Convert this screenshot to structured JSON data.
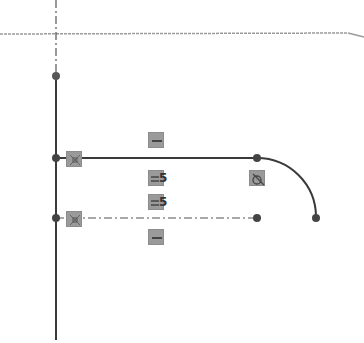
{
  "sketch": {
    "colors": {
      "geometry": "#3a3a3a",
      "construction": "#6a6a6a",
      "axis": "#9a9a9a",
      "constraint_bg": "#9a9a9a"
    },
    "axes": {
      "horizontal_y": 34,
      "vertical_x": 56
    },
    "constraints": [
      {
        "type": "horizontal",
        "x": 148,
        "y": 132
      },
      {
        "type": "equal",
        "x": 148,
        "y": 170,
        "subscript": "5"
      },
      {
        "type": "equal",
        "x": 148,
        "y": 194,
        "subscript": "5"
      },
      {
        "type": "horizontal",
        "x": 148,
        "y": 229
      },
      {
        "type": "perpendicular",
        "x": 66,
        "y": 151
      },
      {
        "type": "perpendicular",
        "x": 66,
        "y": 211
      },
      {
        "type": "tangent",
        "x": 249,
        "y": 170
      }
    ],
    "equal_labels": {
      "upper": "5",
      "lower": "5"
    }
  }
}
